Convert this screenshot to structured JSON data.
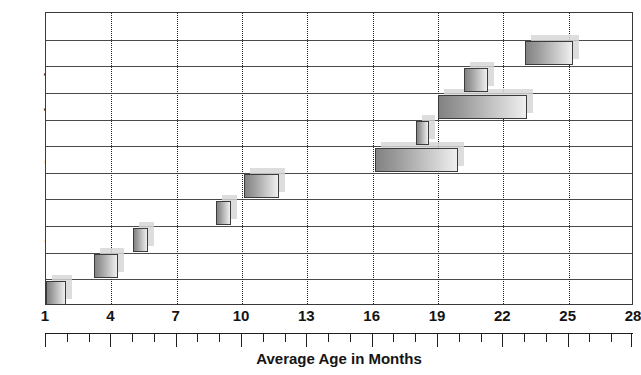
{
  "chart_data": {
    "type": "bar",
    "orientation": "horizontal",
    "title": "",
    "xlabel": "Average Age in Months",
    "ylabel": "Language Comprehension",
    "xlim": [
      1,
      28
    ],
    "ylim": [
      0,
      11
    ],
    "grid": "vertical dotted gridlines at major x ticks; horizontal row separator lines",
    "legend": "none",
    "x_ticks": [
      1,
      4,
      7,
      10,
      13,
      16,
      19,
      22,
      25,
      28
    ],
    "x_tick_labels": [
      "1",
      "4",
      "7",
      "10",
      "13",
      "16",
      "19",
      "22",
      "25",
      "28"
    ],
    "x_minor_tick_step": 1,
    "y_tick_labels": [],
    "bar_colors": {
      "fill_start": "#828282",
      "fill_end": "#efefef",
      "border": "#3b3b3b",
      "shadow": "#d6d6d6"
    },
    "note": "Each horizontal bar is a range (start month to end month) of average age, drawn on its own row. Row 1 is the bottom-most row.",
    "bars": [
      {
        "row": 1,
        "label": "range-1",
        "start": 1.0,
        "end": 1.9
      },
      {
        "row": 2,
        "label": "range-2",
        "start": 3.2,
        "end": 4.3
      },
      {
        "row": 3,
        "label": "range-3",
        "start": 5.0,
        "end": 5.7
      },
      {
        "row": 4,
        "label": "range-4",
        "start": 8.8,
        "end": 9.5
      },
      {
        "row": 5,
        "label": "range-5",
        "start": 10.1,
        "end": 11.7
      },
      {
        "row": 6,
        "label": "range-6",
        "start": 16.1,
        "end": 19.9
      },
      {
        "row": 7,
        "label": "range-7",
        "start": 18.0,
        "end": 18.6
      },
      {
        "row": 8,
        "label": "range-8",
        "start": 19.0,
        "end": 23.1
      },
      {
        "row": 9,
        "label": "range-9",
        "start": 20.2,
        "end": 21.3
      },
      {
        "row": 10,
        "label": "range-10",
        "start": 23.0,
        "end": 25.2
      }
    ]
  },
  "axes": {
    "y_title": "Language Comprehension",
    "x_title": "Average Age in Months"
  }
}
